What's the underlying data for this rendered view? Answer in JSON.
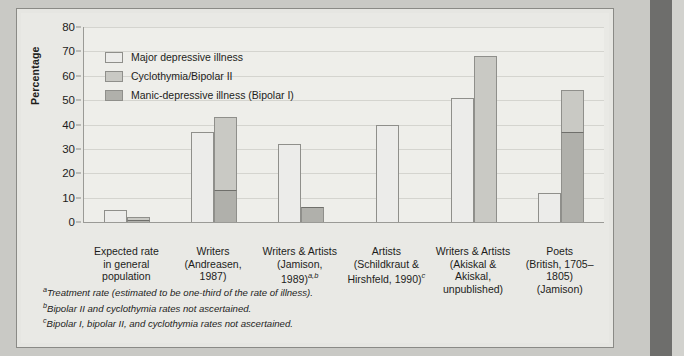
{
  "figure": {
    "ylabel": "Percentage"
  },
  "legend": {
    "items": [
      {
        "label": "Major depressive illness",
        "swatch": "light-gray",
        "color": "#ececea"
      },
      {
        "label": "Cyclothymia/Bipolar II",
        "swatch": "medium-gray",
        "color": "#c9c9c4"
      },
      {
        "label": "Manic-depressive illness (Bipolar I)",
        "swatch": "dark-gray",
        "color": "#b0b0ab"
      }
    ]
  },
  "footnotes": [
    {
      "marker": "a",
      "text": "Treatment rate (estimated to be one-third of the rate of illness)."
    },
    {
      "marker": "b",
      "text": "Bipolar II and cyclothymia rates not ascertained."
    },
    {
      "marker": "c",
      "text": "Bipolar I, bipolar II, and cyclothymia rates not ascertained."
    }
  ],
  "xlabels": [
    {
      "lines": [
        "Expected rate",
        "in general",
        "population"
      ],
      "markers": ""
    },
    {
      "lines": [
        "Writers",
        "(Andreasen,",
        "1987)"
      ],
      "markers": ""
    },
    {
      "lines": [
        "Writers & Artists",
        "(Jamison,",
        "1989)"
      ],
      "markers": "a,b"
    },
    {
      "lines": [
        "Artists",
        "(Schildkraut &",
        "Hirshfeld, 1990)"
      ],
      "markers": "c"
    },
    {
      "lines": [
        "Writers & Artists",
        "(Akiskal &",
        "Akiskal,",
        "unpublished)"
      ],
      "markers": ""
    },
    {
      "lines": [
        "Poets",
        "(British, 1705–1805)",
        "(Jamison)"
      ],
      "markers": ""
    }
  ],
  "chart_data": {
    "type": "bar",
    "title": "",
    "xlabel": "",
    "ylabel": "Percentage",
    "ylim": [
      0,
      80
    ],
    "yticks": [
      0,
      10,
      20,
      30,
      40,
      50,
      60,
      70,
      80
    ],
    "grid": true,
    "legend_position": "upper-left-inside",
    "categories": [
      "Expected rate in general population",
      "Writers (Andreasen, 1987)",
      "Writers & Artists (Jamison, 1989)",
      "Artists (Schildkraut & Hirshfeld, 1990)",
      "Writers & Artists (Akiskal & Akiskal, unpublished)",
      "Poets (British, 1705–1805) (Jamison)"
    ],
    "series": [
      {
        "name": "Major depressive illness",
        "color": "#ececea",
        "values": [
          5,
          37,
          32,
          40,
          51,
          12
        ]
      },
      {
        "name": "Cyclothymia/Bipolar II",
        "color": "#c9c9c4",
        "values": [
          2,
          43,
          6,
          null,
          68,
          54
        ]
      },
      {
        "name": "Manic-depressive illness (Bipolar I)",
        "color": "#b0b0ab",
        "values": [
          1,
          13,
          6,
          null,
          null,
          37
        ]
      }
    ]
  }
}
